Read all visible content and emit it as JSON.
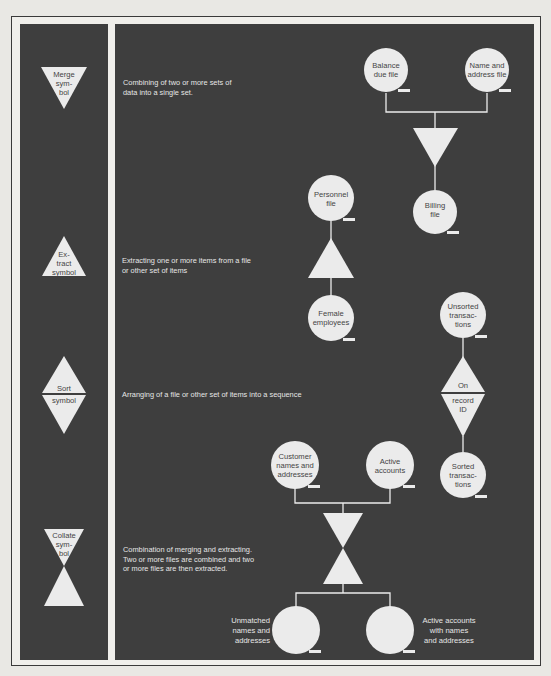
{
  "legend": [
    {
      "symbol": "merge",
      "label": "Merge\nsym-\nbol",
      "description": "Combining of two or more sets of\ndata into a single set."
    },
    {
      "symbol": "extract",
      "label": "Ex-\ntract\nsymbol",
      "description": "Extracting one or more items from a file\nor other set of items"
    },
    {
      "symbol": "sort",
      "label_top": "Sort",
      "label_bottom": "symbol",
      "description": "Arranging of a file or other set of items into a sequence"
    },
    {
      "symbol": "collate",
      "label": "Collate\nsym-\nbol",
      "description": "Combination of merging and extracting.\nTwo or more files are combined and two\nor more files are then extracted."
    }
  ],
  "merge_example": {
    "inputs": [
      "Balance\ndue file",
      "Name and\naddress file"
    ],
    "output": "Billing\nfile"
  },
  "extract_example": {
    "input": "Personnel\nfile",
    "output": "Female\nemployees"
  },
  "sort_example": {
    "input": "Unsorted\ntransac-\ntions",
    "key_top": "On",
    "key_bottom": "record\nID",
    "output": "Sorted\ntransac-\ntions"
  },
  "collate_example": {
    "inputs": [
      "Customer\nnames and\naddresses",
      "Active\naccounts"
    ],
    "outputs": [
      "Unmatched\nnames and\naddresses",
      "Active accounts\nwith names\nand addresses"
    ]
  },
  "colors": {
    "panel": "#3e3e3e",
    "symbol_fill": "#ebebeb",
    "text_light": "#e6e6e6"
  }
}
